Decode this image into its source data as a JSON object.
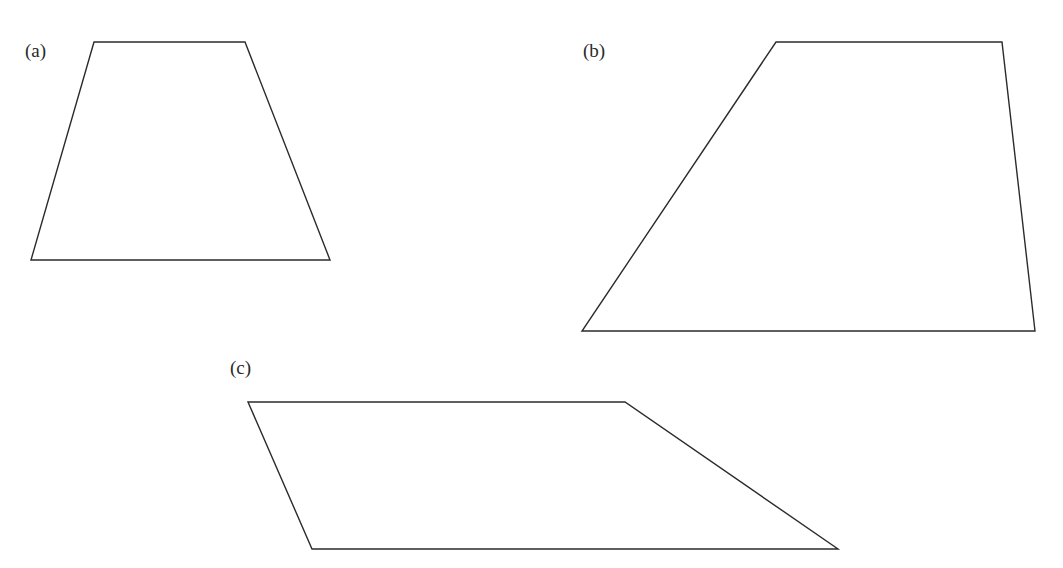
{
  "figure": {
    "panels": [
      {
        "id": "a",
        "label": "(a)",
        "shape": "trapezoid",
        "label_pos": {
          "x": 25,
          "y": 41
        },
        "points": [
          [
            94,
            42
          ],
          [
            245,
            42
          ],
          [
            330,
            260
          ],
          [
            31,
            260
          ]
        ]
      },
      {
        "id": "b",
        "label": "(b)",
        "shape": "trapezoid",
        "label_pos": {
          "x": 583,
          "y": 41
        },
        "points": [
          [
            776,
            42
          ],
          [
            1002,
            42
          ],
          [
            1035,
            331
          ],
          [
            582,
            331
          ]
        ]
      },
      {
        "id": "c",
        "label": "(c)",
        "shape": "trapezoid",
        "label_pos": {
          "x": 230,
          "y": 358
        },
        "points": [
          [
            248,
            402
          ],
          [
            625,
            402
          ],
          [
            838,
            549
          ],
          [
            312,
            549
          ]
        ]
      }
    ],
    "stroke_color": "#2b2b2b",
    "background_color": "#ffffff"
  }
}
